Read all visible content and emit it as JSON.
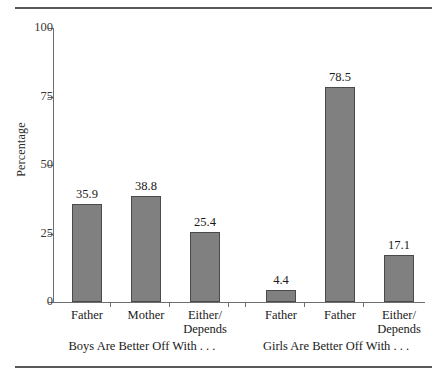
{
  "chart_data": {
    "type": "bar",
    "title": "",
    "xlabel": "",
    "ylabel": "Percentage",
    "ylim": [
      0,
      100
    ],
    "yticks": [
      0,
      25,
      50,
      75,
      100
    ],
    "ytick_labels": [
      "0",
      "25",
      "50",
      "75",
      "100"
    ],
    "grid": false,
    "legend": "none",
    "categories": [
      "Father",
      "Mother",
      "Either/ Depends",
      "Father",
      "Father",
      "Either/ Depends"
    ],
    "values": [
      35.9,
      38.8,
      25.4,
      4.4,
      78.5,
      17.1
    ],
    "value_labels": [
      "35.9",
      "38.8",
      "25.4",
      "4.4",
      "78.5",
      "17.1"
    ],
    "groups": [
      {
        "caption": "Boys Are Better Off With . . .",
        "categories": [
          {
            "line1": "Father",
            "line2": ""
          },
          {
            "line1": "Mother",
            "line2": ""
          },
          {
            "line1": "Either/",
            "line2": "Depends"
          }
        ],
        "values": [
          35.9,
          38.8,
          25.4
        ],
        "value_labels": [
          "35.9",
          "38.8",
          "25.4"
        ]
      },
      {
        "caption": "Girls Are Better Off With . . .",
        "categories": [
          {
            "line1": "Father",
            "line2": ""
          },
          {
            "line1": "Father",
            "line2": ""
          },
          {
            "line1": "Either/",
            "line2": "Depends"
          }
        ],
        "values": [
          4.4,
          78.5,
          17.1
        ],
        "value_labels": [
          "4.4",
          "78.5",
          "17.1"
        ]
      }
    ],
    "colors": {
      "bar_fill": "#808080",
      "bar_border": "#4a4a4a",
      "axis": "#6e6e70",
      "rule": "#59595c",
      "text": "#1a1a1a",
      "background": "#ffffff"
    }
  }
}
